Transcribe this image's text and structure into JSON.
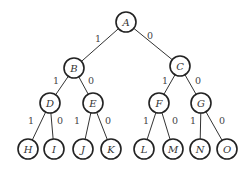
{
  "diagram": {
    "type": "binary-tree",
    "node_radius": 10,
    "nodes": [
      {
        "id": "A",
        "label": "A",
        "x": 126,
        "y": 22
      },
      {
        "id": "B",
        "label": "B",
        "x": 74,
        "y": 68
      },
      {
        "id": "C",
        "label": "C",
        "x": 180,
        "y": 66
      },
      {
        "id": "D",
        "label": "D",
        "x": 50,
        "y": 103
      },
      {
        "id": "E",
        "label": "E",
        "x": 93,
        "y": 103
      },
      {
        "id": "F",
        "label": "F",
        "x": 159,
        "y": 103
      },
      {
        "id": "G",
        "label": "G",
        "x": 201,
        "y": 103
      },
      {
        "id": "H",
        "label": "H",
        "x": 28,
        "y": 149
      },
      {
        "id": "I",
        "label": "I",
        "x": 54,
        "y": 149
      },
      {
        "id": "J",
        "label": "J",
        "x": 83,
        "y": 149
      },
      {
        "id": "K",
        "label": "K",
        "x": 111,
        "y": 149
      },
      {
        "id": "L",
        "label": "L",
        "x": 144,
        "y": 149
      },
      {
        "id": "M",
        "label": "M",
        "x": 173,
        "y": 149
      },
      {
        "id": "N",
        "label": "N",
        "x": 200,
        "y": 149
      },
      {
        "id": "O",
        "label": "O",
        "x": 227,
        "y": 149
      }
    ],
    "edges": [
      {
        "from": "A",
        "to": "B",
        "label": "1",
        "lx": 98,
        "ly": 38
      },
      {
        "from": "A",
        "to": "C",
        "label": "0",
        "lx": 150,
        "ly": 35
      },
      {
        "from": "B",
        "to": "D",
        "label": "1",
        "lx": 56,
        "ly": 80
      },
      {
        "from": "B",
        "to": "E",
        "label": "0",
        "lx": 91,
        "ly": 80
      },
      {
        "from": "C",
        "to": "F",
        "label": "1",
        "lx": 165,
        "ly": 80
      },
      {
        "from": "C",
        "to": "G",
        "label": "0",
        "lx": 198,
        "ly": 80
      },
      {
        "from": "D",
        "to": "H",
        "label": "1",
        "lx": 31,
        "ly": 120
      },
      {
        "from": "D",
        "to": "I",
        "label": "0",
        "lx": 60,
        "ly": 120
      },
      {
        "from": "E",
        "to": "J",
        "label": "1",
        "lx": 77,
        "ly": 120
      },
      {
        "from": "E",
        "to": "K",
        "label": "0",
        "lx": 108,
        "ly": 120
      },
      {
        "from": "F",
        "to": "L",
        "label": "1",
        "lx": 146,
        "ly": 120
      },
      {
        "from": "F",
        "to": "M",
        "label": "0",
        "lx": 175,
        "ly": 120
      },
      {
        "from": "G",
        "to": "N",
        "label": "1",
        "lx": 193,
        "ly": 120
      },
      {
        "from": "G",
        "to": "O",
        "label": "0",
        "lx": 222,
        "ly": 120
      }
    ]
  }
}
